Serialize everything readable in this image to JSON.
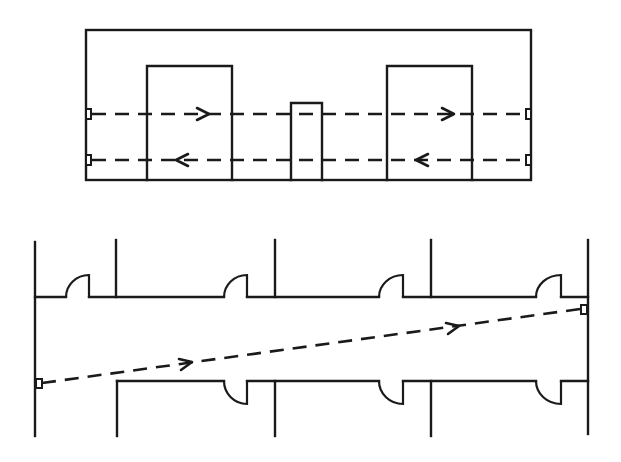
{
  "diagram": {
    "type": "floor-plan beam-path diagram",
    "colors": {
      "ink": "#1a1a1a",
      "background": "#ffffff"
    },
    "top_panel": {
      "outer_room": {
        "x1": 86,
        "y1": 30,
        "x2": 531,
        "y2": 180
      },
      "obstacles": [
        {
          "name": "left-block",
          "x1": 147,
          "y1": 66,
          "x2": 232,
          "y2": 180
        },
        {
          "name": "center-post",
          "x1": 291,
          "y1": 103,
          "x2": 322,
          "y2": 180
        },
        {
          "name": "right-block",
          "x1": 387,
          "y1": 66,
          "x2": 472,
          "y2": 180
        }
      ],
      "beams": [
        {
          "name": "upper-beam",
          "from": [
            88,
            114
          ],
          "to": [
            529,
            114
          ],
          "direction": "left-to-right",
          "arrows_at_x": [
            205,
            450
          ]
        },
        {
          "name": "lower-beam",
          "from": [
            529,
            160
          ],
          "to": [
            88,
            160
          ],
          "direction": "right-to-left",
          "arrows_at_x": [
            180,
            420
          ]
        }
      ],
      "sensors": [
        {
          "name": "sensor-left-upper",
          "x": 88,
          "y": 114
        },
        {
          "name": "sensor-left-lower",
          "x": 88,
          "y": 160
        },
        {
          "name": "sensor-right-upper",
          "x": 529,
          "y": 114
        },
        {
          "name": "sensor-right-lower",
          "x": 529,
          "y": 160
        }
      ]
    },
    "bottom_panel": {
      "corridor": {
        "top_wall_y": 297,
        "bottom_wall_y": 381,
        "left_wall_x": 35,
        "right_wall_x": 588
      },
      "partitions_top_x": [
        116,
        275,
        431
      ],
      "partitions_bottom_x": [
        117,
        275,
        431
      ],
      "doors_top": [
        {
          "x1": 66,
          "x2": 89
        },
        {
          "x1": 224,
          "x2": 247
        },
        {
          "x1": 379,
          "x2": 403
        },
        {
          "x1": 536,
          "x2": 561
        }
      ],
      "doors_bottom": [
        {
          "x1": 224,
          "x2": 247
        },
        {
          "x1": 379,
          "x2": 403
        },
        {
          "x1": 536,
          "x2": 561
        }
      ],
      "beam": {
        "name": "diagonal-beam",
        "from": [
          38,
          384
        ],
        "to": [
          583,
          309
        ],
        "direction": "left-to-right",
        "arrows_at_x": [
          188,
          455
        ]
      },
      "sensors": [
        {
          "name": "sensor-corridor-left",
          "x": 38,
          "y": 384
        },
        {
          "name": "sensor-corridor-right",
          "x": 583,
          "y": 309
        }
      ]
    }
  }
}
